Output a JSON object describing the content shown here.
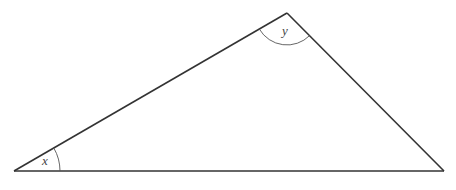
{
  "diagram": {
    "type": "triangle",
    "vertices": {
      "left": [
        14,
        171
      ],
      "apex": [
        287,
        13
      ],
      "right": [
        444,
        171
      ]
    },
    "angles": [
      {
        "label": "x",
        "vertex": "left"
      },
      {
        "label": "y",
        "vertex": "apex"
      }
    ],
    "colors": {
      "stroke": "#333333",
      "arc": "#555555",
      "label": "#444444",
      "background": "#ffffff"
    }
  }
}
